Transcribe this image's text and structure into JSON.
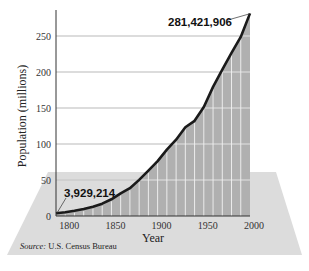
{
  "chart_data": {
    "type": "area",
    "title": "",
    "xlabel": "Year",
    "ylabel": "Population (millions)",
    "x": [
      1790,
      1800,
      1810,
      1820,
      1830,
      1840,
      1850,
      1860,
      1870,
      1880,
      1890,
      1900,
      1910,
      1920,
      1930,
      1940,
      1950,
      1960,
      1970,
      1980,
      1990,
      2000
    ],
    "values": [
      3.9,
      5.3,
      7.2,
      9.6,
      12.9,
      17.1,
      23.2,
      31.4,
      38.6,
      50.2,
      63.0,
      76.2,
      92.2,
      106.0,
      123.2,
      132.2,
      151.3,
      179.3,
      203.3,
      226.5,
      248.7,
      281.4
    ],
    "xticks": [
      "1800",
      "1850",
      "1900",
      "1950",
      "2000"
    ],
    "yticks": [
      "0",
      "50",
      "100",
      "150",
      "200",
      "250"
    ],
    "ylim": [
      0,
      280
    ],
    "xlim": [
      1790,
      2000
    ],
    "grid": true,
    "annotations": [
      {
        "text": "3,929,214",
        "x": 1790,
        "y": 3.9
      },
      {
        "text": "281,421,906",
        "x": 2000,
        "y": 281.4
      }
    ],
    "source": "U.S. Census Bureau",
    "source_label": "Source:"
  },
  "colors": {
    "fill": "#b3b3b3",
    "line": "#1a1a1a",
    "backdrop": "#d8d8d8"
  }
}
